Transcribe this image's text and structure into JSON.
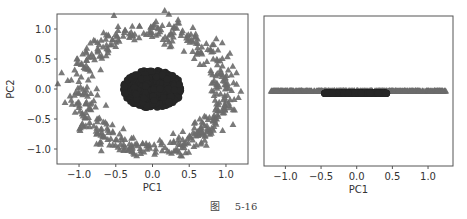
{
  "caption": {
    "prefix": "图",
    "number": "5-16"
  },
  "colors": {
    "triangle": "#6b6b6b",
    "circle": "#262626",
    "frame": "#555555",
    "text": "#333333"
  },
  "chart_data": [
    {
      "type": "scatter",
      "title": "",
      "xlabel": "PC1",
      "ylabel": "PC2",
      "xlim": [
        -1.3,
        1.3
      ],
      "ylim": [
        -1.25,
        1.25
      ],
      "xticks": [
        -1.0,
        -0.5,
        0.0,
        0.5,
        1.0
      ],
      "xtick_labels": [
        "−1.0",
        "−0.5",
        "0.0",
        "0.5",
        "1.0"
      ],
      "yticks": [
        -1.0,
        -0.5,
        0.0,
        0.5,
        1.0
      ],
      "ytick_labels": [
        "−1.0",
        "−0.5",
        "0.0",
        "0.5",
        "1.0"
      ],
      "grid": false,
      "legend": null,
      "series": [
        {
          "name": "outer ring (triangles)",
          "marker": "triangle",
          "shape": "ring",
          "n": 500,
          "radius": 1.0,
          "noise": 0.1,
          "center": [
            0,
            0
          ]
        },
        {
          "name": "inner cluster (circles)",
          "marker": "circle",
          "shape": "blob",
          "n": 500,
          "radius_x": 0.4,
          "radius_y": 0.32,
          "center": [
            0,
            0
          ]
        }
      ]
    },
    {
      "type": "scatter",
      "title": "",
      "xlabel": "PC1",
      "ylabel": "",
      "xlim": [
        -1.3,
        1.35
      ],
      "ylim": [
        -1,
        1
      ],
      "xticks": [
        -1.0,
        -0.5,
        0.0,
        0.5,
        1.0
      ],
      "xtick_labels": [
        "−1.0",
        "−0.5",
        "0.0",
        "0.5",
        "1.0"
      ],
      "yticks": [],
      "grid": false,
      "legend": null,
      "series": [
        {
          "name": "outer ring projected (triangles)",
          "marker": "triangle",
          "shape": "line",
          "n": 500,
          "x_range": [
            -1.2,
            1.25
          ],
          "y": 0.0
        },
        {
          "name": "inner cluster projected (circles)",
          "marker": "circle",
          "shape": "line",
          "n": 500,
          "x_range": [
            -0.45,
            0.42
          ],
          "y": -0.03
        }
      ]
    }
  ]
}
